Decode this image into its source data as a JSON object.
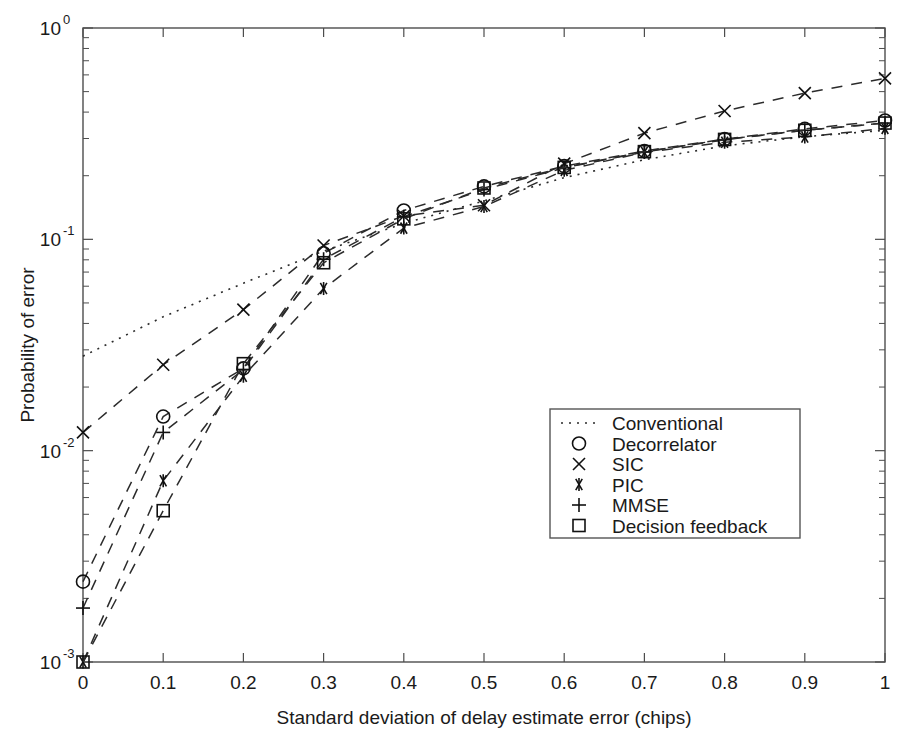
{
  "chart_data": {
    "type": "line",
    "title": "",
    "xlabel": "Standard deviation of delay estimate error (chips)",
    "ylabel": "Probability of error",
    "xlim": [
      0,
      1
    ],
    "ylim": [
      0.001,
      1
    ],
    "yscale": "log",
    "xscale": "linear",
    "grid": false,
    "legend_position": "center-right",
    "x_ticks": [
      "0",
      "0.1",
      "0.2",
      "0.3",
      "0.4",
      "0.5",
      "0.6",
      "0.7",
      "0.8",
      "0.9",
      "1"
    ],
    "x_tick_values": [
      0,
      0.1,
      0.2,
      0.3,
      0.4,
      0.5,
      0.6,
      0.7,
      0.8,
      0.9,
      1
    ],
    "y_ticks": [
      "10^0",
      "10^-1",
      "10^-2",
      "10^-3"
    ],
    "y_tick_values": [
      1,
      0.1,
      0.01,
      0.001
    ],
    "y_tick_mantissa": "10",
    "y_tick_exponents": [
      "0",
      "-1",
      "-2",
      "-3"
    ],
    "x": [
      0,
      0.1,
      0.2,
      0.3,
      0.4,
      0.5,
      0.6,
      0.7,
      0.8,
      0.9,
      1
    ],
    "series": [
      {
        "name": "Conventional",
        "marker": "none",
        "linestyle": "dotted",
        "values": [
          0.028,
          0.043,
          0.062,
          0.088,
          0.119,
          0.152,
          0.196,
          0.238,
          0.277,
          0.306,
          0.328
        ]
      },
      {
        "name": "Decorrelator",
        "marker": "circle",
        "linestyle": "dashed",
        "values": [
          0.0024,
          0.0145,
          0.0245,
          0.086,
          0.137,
          0.178,
          0.222,
          0.262,
          0.298,
          0.333,
          0.365
        ]
      },
      {
        "name": "SIC",
        "marker": "x",
        "linestyle": "dashed",
        "values": [
          0.0122,
          0.0255,
          0.0465,
          0.0935,
          0.129,
          0.145,
          0.228,
          0.318,
          0.405,
          0.492,
          0.578
        ]
      },
      {
        "name": "PIC",
        "marker": "asterisk",
        "linestyle": "dashed",
        "values": [
          0.001,
          0.0072,
          0.0225,
          0.0585,
          0.113,
          0.143,
          0.212,
          0.258,
          0.288,
          0.305,
          0.335
        ]
      },
      {
        "name": "MMSE",
        "marker": "plus",
        "linestyle": "dashed",
        "values": [
          0.0018,
          0.0122,
          0.0242,
          0.0805,
          0.128,
          0.172,
          0.218,
          0.259,
          0.296,
          0.328,
          0.355
        ]
      },
      {
        "name": "Decision feedback",
        "marker": "square",
        "linestyle": "dashed",
        "values": [
          0.001,
          0.0052,
          0.0258,
          0.0775,
          0.125,
          0.175,
          0.219,
          0.26,
          0.297,
          0.328,
          0.355
        ]
      }
    ]
  },
  "legend": {
    "entries": [
      {
        "label": "Conventional"
      },
      {
        "label": "Decorrelator"
      },
      {
        "label": "SIC"
      },
      {
        "label": "PIC"
      },
      {
        "label": "MMSE"
      },
      {
        "label": "Decision feedback"
      }
    ]
  }
}
